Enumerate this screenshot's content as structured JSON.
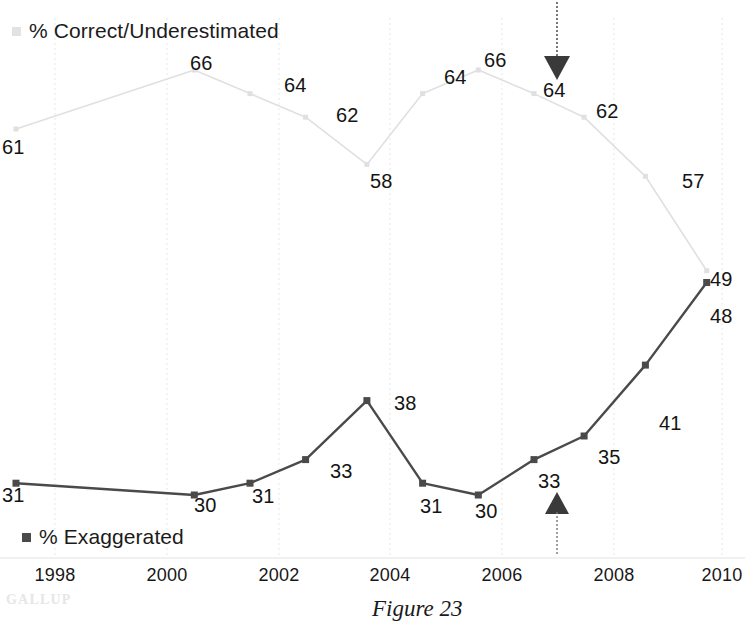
{
  "figure": {
    "caption": "Figure 23",
    "watermark": "GALLUP"
  },
  "legend": {
    "correct": {
      "label": "% Correct/Underestimated",
      "swatch_icon": "light-square-marker",
      "color": "#e2e2e2"
    },
    "exaggerated": {
      "label": "% Exaggerated",
      "swatch_icon": "dark-square-marker",
      "color": "#4a4a4a"
    }
  },
  "annotations": [
    {
      "name": "down-arrow-2007",
      "icon": "arrow-down-icon",
      "points_to": "64",
      "year": 2007
    },
    {
      "name": "up-arrow-2007",
      "icon": "arrow-up-icon",
      "points_to": "33",
      "year": 2007
    }
  ],
  "axis": {
    "x_ticks": [
      "1998",
      "2000",
      "2002",
      "2004",
      "2006",
      "2008",
      "2010"
    ]
  },
  "chart_data": {
    "type": "line",
    "title": "",
    "xlabel": "",
    "ylabel": "",
    "grid": "vertical-dotted-at-even-years",
    "legend_position": "inline-top-left-and-bottom-left",
    "x": [
      1997.3,
      2000.5,
      2001.5,
      2002.5,
      2003.6,
      2004.6,
      2005.6,
      2006.6,
      2007.5,
      2008.6,
      2009.7
    ],
    "xlim": [
      1997.0,
      2010.3
    ],
    "ylim": [
      25,
      70
    ],
    "series": [
      {
        "name": "% Correct/Underestimated",
        "color": "#e0e0e0",
        "values": [
          61,
          66,
          64,
          62,
          58,
          64,
          66,
          64,
          62,
          57,
          49
        ],
        "labels": [
          "61",
          "66",
          "64",
          "62",
          "58",
          "64",
          "66",
          "64",
          "62",
          "57",
          "49"
        ]
      },
      {
        "name": "% Exaggerated",
        "color": "#4a4a4a",
        "values": [
          31,
          30,
          31,
          33,
          38,
          31,
          30,
          33,
          35,
          41,
          48
        ],
        "labels": [
          "31",
          "30",
          "31",
          "33",
          "38",
          "31",
          "30",
          "33",
          "35",
          "41",
          "48"
        ]
      }
    ]
  },
  "point_labels": {
    "correct": [
      {
        "text": "61",
        "x": 2,
        "y": 136
      },
      {
        "text": "66",
        "x": 190,
        "y": 52
      },
      {
        "text": "64",
        "x": 284,
        "y": 74
      },
      {
        "text": "62",
        "x": 336,
        "y": 104
      },
      {
        "text": "58",
        "x": 370,
        "y": 170
      },
      {
        "text": "64",
        "x": 444,
        "y": 66
      },
      {
        "text": "66",
        "x": 484,
        "y": 49
      },
      {
        "text": "64",
        "x": 543,
        "y": 79
      },
      {
        "text": "62",
        "x": 596,
        "y": 100
      },
      {
        "text": "57",
        "x": 682,
        "y": 170
      },
      {
        "text": "49",
        "x": 710,
        "y": 268
      }
    ],
    "exaggerated": [
      {
        "text": "31",
        "x": 2,
        "y": 484
      },
      {
        "text": "30",
        "x": 194,
        "y": 494
      },
      {
        "text": "31",
        "x": 252,
        "y": 485
      },
      {
        "text": "33",
        "x": 330,
        "y": 460
      },
      {
        "text": "38",
        "x": 394,
        "y": 392
      },
      {
        "text": "31",
        "x": 420,
        "y": 495
      },
      {
        "text": "30",
        "x": 475,
        "y": 500
      },
      {
        "text": "33",
        "x": 538,
        "y": 470
      },
      {
        "text": "35",
        "x": 598,
        "y": 446
      },
      {
        "text": "41",
        "x": 659,
        "y": 412
      },
      {
        "text": "48",
        "x": 710,
        "y": 305
      }
    ]
  },
  "x_tick_positions": [
    {
      "label": "1998",
      "x": 55
    },
    {
      "label": "2000",
      "x": 167
    },
    {
      "label": "2002",
      "x": 279
    },
    {
      "label": "2004",
      "x": 390
    },
    {
      "label": "2006",
      "x": 502
    },
    {
      "label": "2008",
      "x": 614
    },
    {
      "label": "2010",
      "x": 722
    }
  ]
}
